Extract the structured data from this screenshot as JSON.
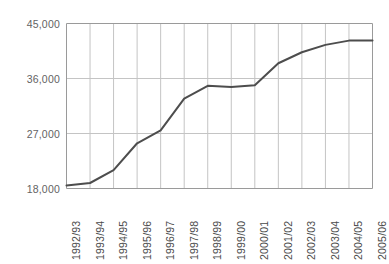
{
  "chart_data": {
    "type": "line",
    "title": "",
    "subtitle": "",
    "xlabel": "",
    "ylabel": "",
    "categories": [
      "1992/93",
      "1993/94",
      "1994/95",
      "1995/96",
      "1996/97",
      "1997/98",
      "1998/99",
      "1999/00",
      "2000/01",
      "2001/02",
      "2002/03",
      "2003/04",
      "2004/05",
      "2005/06"
    ],
    "values": [
      18500,
      18900,
      21000,
      25400,
      27500,
      32700,
      34800,
      34600,
      34900,
      38500,
      40300,
      41500,
      42200,
      42200
    ],
    "ytick_labels": [
      "45,000",
      "36,000",
      "27,000",
      "18,000"
    ],
    "yticks": [
      45000,
      36000,
      27000,
      18000
    ],
    "ylim": [
      18000,
      45000
    ],
    "grid": "both",
    "legend": "none",
    "series_name": "",
    "line_color": "#4d4d4d",
    "grid_color": "#c4c4c4",
    "axis_color": "#9a9a9a",
    "label_color": "#636363",
    "background": "#ffffff"
  }
}
